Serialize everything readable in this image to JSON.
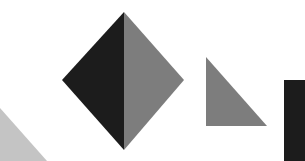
{
  "canvas": {
    "width": 305,
    "height": 161,
    "background": "#ffffff"
  },
  "shapes": {
    "diamond": {
      "name": "diamond",
      "left_half": {
        "points": "124,12 62,80 124,150",
        "color": "#1c1c1c"
      },
      "right_half": {
        "points": "124,12 184,80 124,150",
        "color": "#7d7d7d"
      }
    },
    "right_triangle": {
      "name": "right-triangle",
      "points": "206,57 206,126 267,126",
      "color": "#7d7d7d"
    },
    "black_rectangle": {
      "name": "black-rectangle",
      "x": 284,
      "y": 80,
      "width": 21,
      "height": 81,
      "color": "#1c1c1c"
    },
    "corner_triangle": {
      "name": "corner-triangle",
      "points": "0,108 47,161 0,161",
      "color": "#c4c4c4"
    }
  }
}
